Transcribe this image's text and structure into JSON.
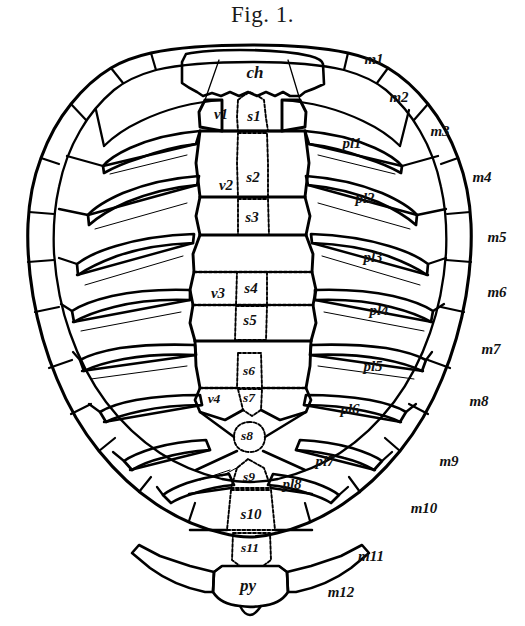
{
  "figure": {
    "title": "Fig. 1.",
    "background_color": "#ffffff",
    "ink_color": "#000000"
  },
  "labels": {
    "nuchal": {
      "text": "ch",
      "x": 255,
      "y": 72,
      "size": "sz-lg"
    },
    "vertebral": [
      {
        "text": "v1",
        "x": 221,
        "y": 114,
        "size": "sz-md"
      },
      {
        "text": "v2",
        "x": 226,
        "y": 185,
        "size": "sz-md"
      },
      {
        "text": "v3",
        "x": 218,
        "y": 293,
        "size": "sz-md"
      },
      {
        "text": "v4",
        "x": 214,
        "y": 399,
        "size": "sz-sm"
      }
    ],
    "neural": [
      {
        "text": "s1",
        "x": 254,
        "y": 116,
        "size": "sz-md"
      },
      {
        "text": "s2",
        "x": 253,
        "y": 177,
        "size": "sz-md"
      },
      {
        "text": "s3",
        "x": 252,
        "y": 217,
        "size": "sz-md"
      },
      {
        "text": "s4",
        "x": 251,
        "y": 288,
        "size": "sz-md"
      },
      {
        "text": "s5",
        "x": 250,
        "y": 320,
        "size": "sz-md"
      },
      {
        "text": "s6",
        "x": 249,
        "y": 371,
        "size": "sz-sm"
      },
      {
        "text": "s7",
        "x": 249,
        "y": 398,
        "size": "sz-sm"
      },
      {
        "text": "s8",
        "x": 247,
        "y": 436,
        "size": "sz-sm"
      },
      {
        "text": "s9",
        "x": 249,
        "y": 477,
        "size": "sz-sm"
      },
      {
        "text": "s10",
        "x": 251,
        "y": 514,
        "size": "sz-md"
      },
      {
        "text": "s11",
        "x": 250,
        "y": 548,
        "size": "sz-sm"
      }
    ],
    "pygal": {
      "text": "py",
      "x": 248,
      "y": 585,
      "size": "sz-lg"
    },
    "pleural": [
      {
        "text": "pl1",
        "x": 352,
        "y": 143,
        "size": "sz-md"
      },
      {
        "text": "pl2",
        "x": 365,
        "y": 198,
        "size": "sz-md"
      },
      {
        "text": "pl3",
        "x": 373,
        "y": 257,
        "size": "sz-md"
      },
      {
        "text": "pl4",
        "x": 379,
        "y": 310,
        "size": "sz-md"
      },
      {
        "text": "pl5",
        "x": 373,
        "y": 366,
        "size": "sz-md"
      },
      {
        "text": "pl6",
        "x": 350,
        "y": 409,
        "size": "sz-md"
      },
      {
        "text": "pl7",
        "x": 325,
        "y": 461,
        "size": "sz-md"
      },
      {
        "text": "pl8",
        "x": 292,
        "y": 484,
        "size": "sz-md"
      }
    ],
    "marginal": [
      {
        "text": "m1",
        "x": 374,
        "y": 59,
        "size": "sz-md"
      },
      {
        "text": "m2",
        "x": 399,
        "y": 97,
        "size": "sz-md"
      },
      {
        "text": "m3",
        "x": 440,
        "y": 131,
        "size": "sz-md"
      },
      {
        "text": "m4",
        "x": 482,
        "y": 177,
        "size": "sz-md"
      },
      {
        "text": "m5",
        "x": 497,
        "y": 237,
        "size": "sz-md"
      },
      {
        "text": "m6",
        "x": 497,
        "y": 292,
        "size": "sz-md"
      },
      {
        "text": "m7",
        "x": 491,
        "y": 349,
        "size": "sz-md"
      },
      {
        "text": "m8",
        "x": 479,
        "y": 401,
        "size": "sz-md"
      },
      {
        "text": "m9",
        "x": 449,
        "y": 461,
        "size": "sz-md"
      },
      {
        "text": "m10",
        "x": 424,
        "y": 508,
        "size": "sz-md"
      },
      {
        "text": "m11",
        "x": 371,
        "y": 556,
        "size": "sz-md"
      },
      {
        "text": "m12",
        "x": 341,
        "y": 592,
        "size": "sz-md"
      }
    ]
  }
}
